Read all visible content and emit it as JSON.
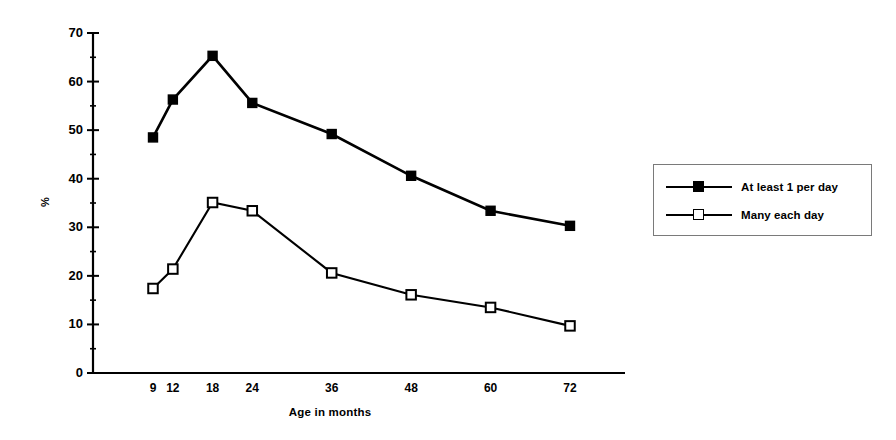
{
  "chart_data": {
    "type": "line",
    "title": "",
    "xlabel": "Age in months",
    "ylabel": "%",
    "x": [
      9,
      12,
      18,
      24,
      36,
      48,
      60,
      72
    ],
    "xtick_labels": [
      "9",
      "12",
      "18",
      "24",
      "36",
      "48",
      "60",
      "72"
    ],
    "xlim": [
      6,
      75
    ],
    "ylim": [
      0,
      70
    ],
    "ytick_labels": [
      "0",
      "10",
      "20",
      "30",
      "40",
      "50",
      "60",
      "70"
    ],
    "ytick_values": [
      0,
      10,
      20,
      30,
      40,
      50,
      60,
      70
    ],
    "yminor_step": 5,
    "grid": false,
    "legend_position": "right-outside",
    "series": [
      {
        "name": "At least 1 per day",
        "marker": "filled-square",
        "color": "#000000",
        "values": [
          48.5,
          56.3,
          65.3,
          55.6,
          49.2,
          40.6,
          33.4,
          30.3
        ]
      },
      {
        "name": "Many each day",
        "marker": "open-square",
        "color": "#000000",
        "values": [
          17.4,
          21.4,
          35.1,
          33.4,
          20.6,
          16.1,
          13.5,
          9.7
        ]
      }
    ]
  },
  "legend": {
    "items": [
      {
        "label": "At least 1 per day",
        "marker": "filled-square"
      },
      {
        "label": "Many each day",
        "marker": "open-square"
      }
    ]
  }
}
